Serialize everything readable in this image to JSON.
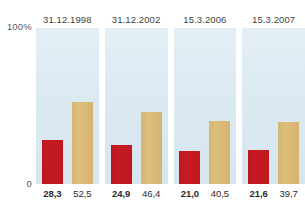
{
  "axis": {
    "top_label": "100%",
    "bottom_label": "0"
  },
  "colors": {
    "series_primary": "#c61a22",
    "series_secondary": "#d8b974",
    "panel_background": "#dce9f1"
  },
  "chart_data": {
    "type": "bar",
    "title": "",
    "xlabel": "",
    "ylabel": "",
    "ylim": [
      0,
      100
    ],
    "grid": false,
    "legend": "none",
    "categories": [
      "31.12.1998",
      "31.12.2002",
      "15.3.2006",
      "15.3.2007"
    ],
    "series": [
      {
        "name": "primary",
        "color": "#c61a22",
        "values": [
          28.3,
          46.4,
          21.0,
          21.6
        ]
      },
      {
        "name": "secondary",
        "color": "#d8b974",
        "values": [
          52.5,
          46.4,
          40.5,
          39.7
        ]
      }
    ],
    "panels": [
      {
        "header": "31.12.1998",
        "bars": [
          {
            "series": "primary",
            "value": 28.3,
            "label": "28,3",
            "emphasis": true
          },
          {
            "series": "secondary",
            "value": 52.5,
            "label": "52,5",
            "emphasis": false
          }
        ]
      },
      {
        "header": "31.12.2002",
        "bars": [
          {
            "series": "primary",
            "value": 24.9,
            "label": "24,9",
            "emphasis": true
          },
          {
            "series": "secondary",
            "value": 46.4,
            "label": "46,4",
            "emphasis": false
          }
        ]
      },
      {
        "header": "15.3.2006",
        "bars": [
          {
            "series": "primary",
            "value": 21.0,
            "label": "21,0",
            "emphasis": true
          },
          {
            "series": "secondary",
            "value": 40.5,
            "label": "40,5",
            "emphasis": false
          }
        ]
      },
      {
        "header": "15.3.2007",
        "bars": [
          {
            "series": "primary",
            "value": 21.6,
            "label": "21,6",
            "emphasis": true
          },
          {
            "series": "secondary",
            "value": 39.7,
            "label": "39,7",
            "emphasis": false
          }
        ]
      }
    ]
  }
}
